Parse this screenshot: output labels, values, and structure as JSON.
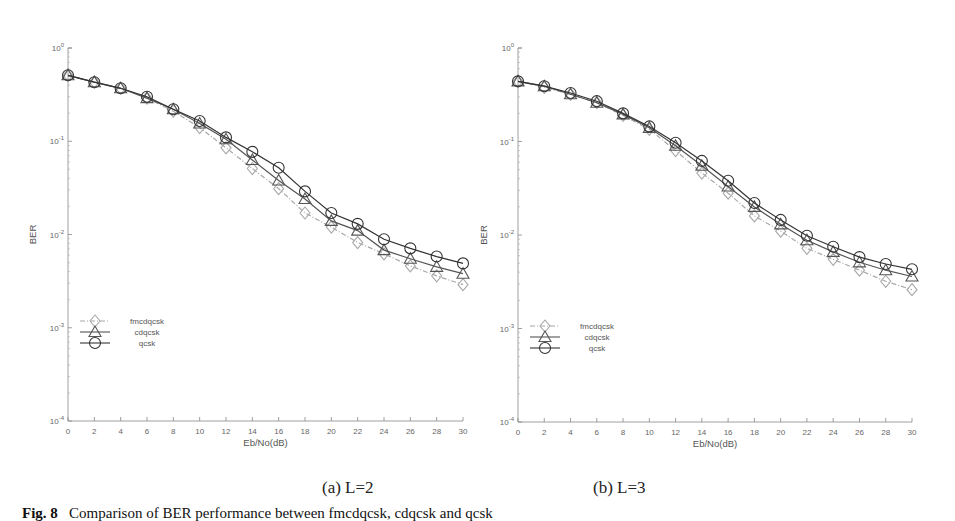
{
  "figure": {
    "caption_line": "Fig. 8   Comparison of BER performance between fmcdqcsk, cdqcsk and qcsk",
    "caption_prefix": "Fig. 8",
    "caption_text": "Comparison of BER performance between fmcdqcsk, cdqcsk and qcsk",
    "subcaptions": [
      "(a)  L=2",
      "(b)  L=3"
    ]
  },
  "chart_data": [
    {
      "type": "line",
      "title": "(a) L=2",
      "xlabel": "Eb/No(dB)",
      "ylabel": "BER",
      "yscale": "log",
      "xlim": [
        0,
        30
      ],
      "ylim": [
        0.0001,
        1
      ],
      "x_ticks": [
        0,
        2,
        4,
        6,
        8,
        10,
        12,
        14,
        16,
        18,
        20,
        22,
        24,
        26,
        28,
        30
      ],
      "y_ticks": [
        "10^0",
        "10^-1",
        "10^-2",
        "10^-3",
        "10^-4"
      ],
      "grid": false,
      "legend_position": "left-middle",
      "x": [
        0,
        2,
        4,
        6,
        8,
        10,
        12,
        14,
        16,
        18,
        20,
        22,
        24,
        26,
        28,
        30
      ],
      "series": [
        {
          "name": "fmcdqcsk",
          "marker": "diamond",
          "line": "dash-dot",
          "color": "#a8a8a8",
          "values": [
            0.51,
            0.43,
            0.37,
            0.29,
            0.21,
            0.14,
            0.085,
            0.051,
            0.031,
            0.017,
            0.012,
            0.0082,
            0.0062,
            0.0046,
            0.0036,
            0.0029
          ]
        },
        {
          "name": "cdqcsk",
          "marker": "triangle",
          "line": "solid",
          "color": "#555555",
          "values": [
            0.51,
            0.43,
            0.37,
            0.29,
            0.22,
            0.155,
            0.105,
            0.063,
            0.038,
            0.024,
            0.014,
            0.011,
            0.0068,
            0.0055,
            0.0045,
            0.0038
          ]
        },
        {
          "name": "qcsk",
          "marker": "circle",
          "line": "solid",
          "color": "#333333",
          "values": [
            0.51,
            0.43,
            0.37,
            0.3,
            0.22,
            0.165,
            0.11,
            0.077,
            0.052,
            0.029,
            0.017,
            0.013,
            0.0089,
            0.0071,
            0.0058,
            0.0049
          ]
        }
      ]
    },
    {
      "type": "line",
      "title": "(b) L=3",
      "xlabel": "Eb/No(dB)",
      "ylabel": "BER",
      "yscale": "log",
      "xlim": [
        0,
        30
      ],
      "ylim": [
        0.0001,
        1
      ],
      "x_ticks": [
        0,
        2,
        4,
        6,
        8,
        10,
        12,
        14,
        16,
        18,
        20,
        22,
        24,
        26,
        28,
        30
      ],
      "y_ticks": [
        "10^0",
        "10^-1",
        "10^-2",
        "10^-3",
        "10^-4"
      ],
      "grid": false,
      "legend_position": "left-middle",
      "x": [
        0,
        2,
        4,
        6,
        8,
        10,
        12,
        14,
        16,
        18,
        20,
        22,
        24,
        26,
        28,
        30
      ],
      "series": [
        {
          "name": "fmcdqcsk",
          "marker": "diamond",
          "line": "dash-dot",
          "color": "#a8a8a8",
          "values": [
            0.44,
            0.38,
            0.32,
            0.26,
            0.19,
            0.135,
            0.08,
            0.046,
            0.028,
            0.016,
            0.011,
            0.0072,
            0.0055,
            0.0042,
            0.0032,
            0.0026
          ]
        },
        {
          "name": "cdqcsk",
          "marker": "triangle",
          "line": "solid",
          "color": "#555555",
          "values": [
            0.44,
            0.39,
            0.32,
            0.26,
            0.195,
            0.14,
            0.09,
            0.055,
            0.033,
            0.02,
            0.013,
            0.0088,
            0.0066,
            0.0051,
            0.0042,
            0.0036
          ]
        },
        {
          "name": "qcsk",
          "marker": "circle",
          "line": "solid",
          "color": "#333333",
          "values": [
            0.44,
            0.39,
            0.33,
            0.27,
            0.2,
            0.145,
            0.097,
            0.062,
            0.038,
            0.022,
            0.0145,
            0.0098,
            0.0075,
            0.0058,
            0.0049,
            0.0043
          ]
        }
      ]
    }
  ],
  "layout": {
    "panels": [
      {
        "x0": 68,
        "x1": 463,
        "yTop": 48,
        "yBot": 421,
        "ylabel_x": 36,
        "legend_x": 92,
        "legend_y": 321,
        "sub_x": 322,
        "sub_y": 478
      },
      {
        "x0": 518,
        "x1": 912,
        "yTop": 48,
        "yBot": 422,
        "ylabel_x": 487,
        "legend_x": 542,
        "legend_y": 326,
        "sub_x": 593,
        "sub_y": 478
      }
    ]
  }
}
